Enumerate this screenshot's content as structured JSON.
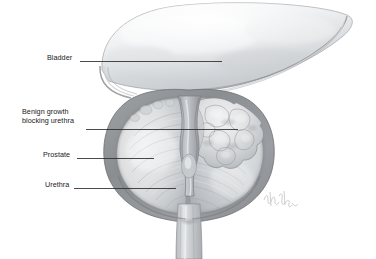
{
  "figure": {
    "kind": "medical-illustration",
    "background_color": "#ffffff",
    "style": "grayscale pencil / airbrush anatomical drawing",
    "width": 376,
    "height": 259
  },
  "labels": [
    {
      "id": "bladder",
      "text": "Bladder",
      "text_x": 47,
      "text_y": 57,
      "align": "left",
      "leader": {
        "x1": 80,
        "y1": 61.5,
        "x2": 222,
        "y2": 61.5
      }
    },
    {
      "id": "benign-growth",
      "line1": "Benign growth",
      "line2": "blocking urethra",
      "text_x": 22,
      "text_y": 111,
      "align": "left",
      "leader": {
        "x1": 86,
        "y1": 129.5,
        "x2": 238,
        "y2": 129.5
      }
    },
    {
      "id": "prostate",
      "text": "Prostate",
      "text_x": 43,
      "text_y": 154,
      "align": "left",
      "leader": {
        "x1": 77,
        "y1": 158.5,
        "x2": 154,
        "y2": 158.5
      }
    },
    {
      "id": "urethra",
      "text": "Urethra",
      "text_x": 45,
      "text_y": 184,
      "align": "left",
      "leader": {
        "x1": 74,
        "y1": 188.5,
        "x2": 176,
        "y2": 188.5
      }
    }
  ],
  "anatomy": {
    "bladder_label": "Bladder",
    "prostate_label": "Prostate",
    "urethra_label": "Urethra",
    "growth_label": "Benign growth blocking urethra",
    "urethra_channel_label": "prostatic urethra (compressed)",
    "left_lobe_label": "left prostatic lobe",
    "right_lobe_label": "right prostatic lobe with adenomatous nodules",
    "capsule_label": "prostatic capsule",
    "bladder_neck_label": "bladder neck / internal sphincter",
    "distal_urethra_label": "membranous urethra"
  },
  "signature": {
    "present": true,
    "description": "faint cursive artist signature, lower right of prostate"
  },
  "colors": {
    "leader_line": "#2b2b2b",
    "text": "#1a1a1a",
    "background": "#ffffff",
    "capsule_dark": "#8d8f92",
    "capsule_mid": "#a9abae",
    "tissue_light": "#dcdee0",
    "tissue_mid": "#c3c6c9",
    "bladder_light": "#eceef0",
    "bladder_mid": "#cfd2d5",
    "outline": "#6f7174"
  }
}
